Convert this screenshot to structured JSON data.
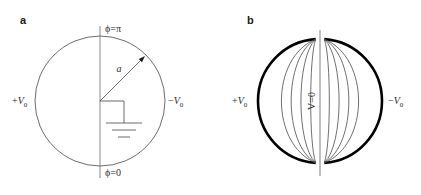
{
  "figure": {
    "background_color": "#ffffff",
    "width": 421,
    "height": 195,
    "line_color": "#555555",
    "bold_line_color": "#000000",
    "text_color": "#2b2b2b"
  },
  "panels": [
    {
      "id": "panel-a",
      "letter": "a",
      "letter_x": 20,
      "letter_y": 24,
      "center_x": 100,
      "center_y": 101,
      "radius": 65,
      "axis_top_y": 26,
      "axis_bottom_y": 178,
      "labels": {
        "top": "ϕ=π",
        "top_x": 105,
        "top_y": 32,
        "bottom": "ϕ=0",
        "bottom_x": 105,
        "bottom_y": 176,
        "left_sign": "+",
        "left_symbol": "V",
        "left_sub": "0",
        "left_x": 12,
        "left_y": 104,
        "right_sign": "−",
        "right_symbol": "V",
        "right_sub": "0",
        "right_x": 168,
        "right_y": 104,
        "radius_symbol": "a",
        "radius_x": 119,
        "radius_y": 72
      },
      "radius_arrow": {
        "from_x": 100,
        "from_y": 101,
        "to_x": 145,
        "to_y": 56
      },
      "ground_symbol": {
        "stem_top_x": 100,
        "stem_top_y": 101,
        "corner_x": 124,
        "corner_y": 105,
        "bar1_y": 123,
        "bar1_half": 18,
        "bar2_y": 130,
        "bar2_half": 12,
        "bar3_y": 137,
        "bar3_half": 6,
        "bar_center_x": 124
      }
    },
    {
      "id": "panel-b",
      "letter": "b",
      "letter_x": 247,
      "letter_y": 24,
      "center_x": 320,
      "center_y": 101,
      "radius": 62,
      "axis_top_y": 30,
      "axis_bottom_y": 176,
      "gap_half_angle_deg": 4,
      "equipotential_count": 4,
      "equipotential_offsets": [
        50,
        37,
        24,
        11
      ],
      "labels": {
        "center": "V=0",
        "center_x": 315,
        "center_y": 101,
        "center_rotation": -90,
        "left_sign": "+",
        "left_symbol": "V",
        "left_sub": "0",
        "left_x": 232,
        "left_y": 104,
        "right_sign": "−",
        "right_symbol": "V",
        "right_sub": "0",
        "right_x": 388,
        "right_y": 104
      }
    }
  ],
  "chart_data": {
    "type": "diagram",
    "panels": [
      {
        "label": "a",
        "elements": [
          "circle boundary",
          "vertical axis line",
          "radius arrow a",
          "ground symbol"
        ],
        "annotations": [
          "ϕ=π",
          "ϕ=0",
          "+V₀",
          "−V₀",
          "a"
        ]
      },
      {
        "label": "b",
        "elements": [
          "bold left electrode arc",
          "bold right electrode arc",
          "equipotential curves",
          "vertical axis line"
        ],
        "annotations": [
          "+V₀",
          "−V₀",
          "V=0"
        ],
        "equipotentials_per_side": 4
      }
    ]
  }
}
